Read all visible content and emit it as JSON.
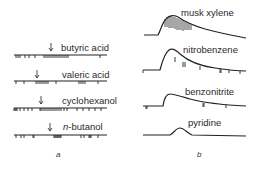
{
  "panel_a": {
    "label": "a",
    "traces": [
      {
        "name": "butyric acid"
      },
      {
        "name": "valeric acid"
      },
      {
        "name": "cyclohexanol"
      },
      {
        "name_prefix": "n",
        "name_rest": "-butanol"
      }
    ]
  },
  "panel_b": {
    "label": "b",
    "traces": [
      {
        "name": "musk xylene"
      },
      {
        "name": "nitrobenzene"
      },
      {
        "name": "benzonitrite"
      },
      {
        "name": "pyridine"
      }
    ]
  },
  "colors": {
    "ink": "#222222",
    "background": "#ffffff"
  }
}
